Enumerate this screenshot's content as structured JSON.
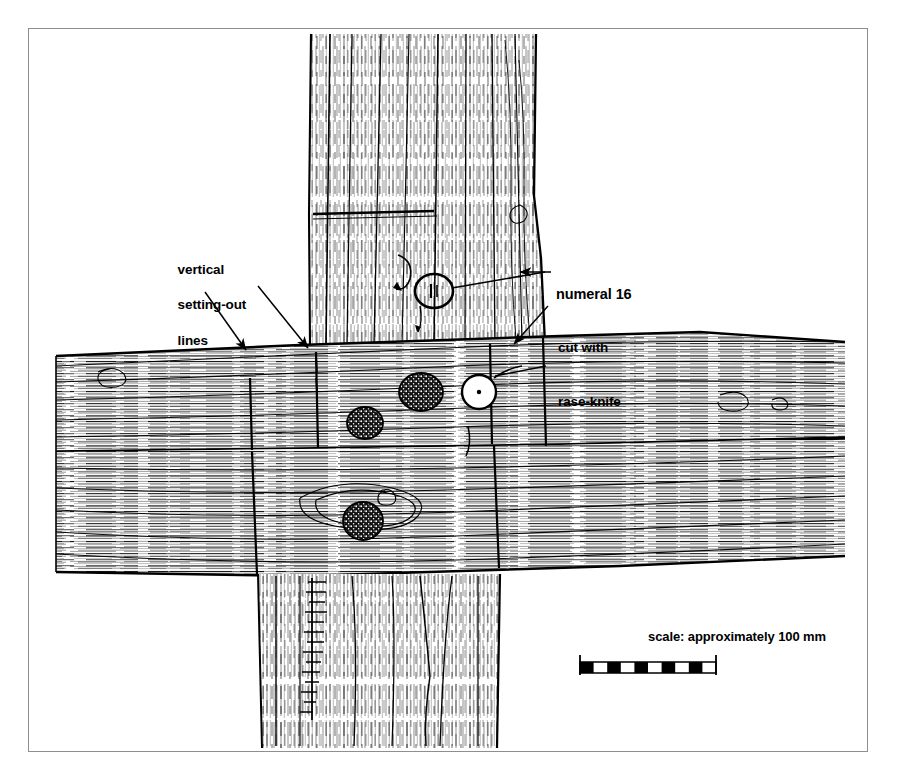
{
  "figure": {
    "kind": "archaeological-measured-drawing",
    "background_color": "#ffffff",
    "ink_color": "#000000",
    "frame_color": "#8e8e8e"
  },
  "annotations": {
    "vertical_lines": {
      "line1": "vertical",
      "line2": "setting-out",
      "line3": "lines"
    },
    "numeral": {
      "line1": "numeral 16",
      "line2": "cut with",
      "line3": "rase-knife"
    }
  },
  "scale": {
    "caption": "scale: approximately 100 mm",
    "segments": 10,
    "bar_length_px": 136
  },
  "features": {
    "peg_holes": 3,
    "rase_knife_marks": 2,
    "setting_out_lines": 4,
    "leader_arrows": 4
  }
}
